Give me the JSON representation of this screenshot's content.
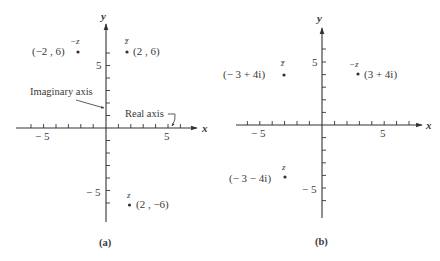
{
  "panels": [
    {
      "id": "a",
      "caption": "(a)",
      "origin_px": [
        106,
        128
      ],
      "unit_px": 12.4,
      "x_axis_label": "x",
      "y_axis_label": "y",
      "x_ticks_labeled": [
        {
          "value": -5,
          "label": "− 5"
        },
        {
          "value": 5,
          "label": "5"
        }
      ],
      "y_ticks_labeled": [
        {
          "value": 5,
          "label": "5"
        },
        {
          "value": -5,
          "label": "− 5"
        }
      ],
      "annotations": [
        {
          "text": "Imaginary axis",
          "points_to": "y-axis"
        },
        {
          "text": "Real axis",
          "points_to": "x-axis"
        }
      ],
      "points": [
        {
          "name": "−z",
          "coord_label": "(−2 , 6)",
          "x": -2,
          "y": 6
        },
        {
          "name": "z̅",
          "coord_label": "(2 , 6)",
          "x": 2,
          "y": 6
        },
        {
          "name": "z",
          "coord_label": "(2 , −6)",
          "x": 2,
          "y": -6
        }
      ]
    },
    {
      "id": "b",
      "caption": "(b)",
      "origin_px": [
        322,
        125
      ],
      "unit_px": 12.6,
      "x_axis_label": "x",
      "y_axis_label": "y",
      "x_ticks_labeled": [
        {
          "value": -5,
          "label": "− 5"
        },
        {
          "value": 5,
          "label": "5"
        }
      ],
      "y_ticks_labeled": [
        {
          "value": 5,
          "label": "5"
        },
        {
          "value": -5,
          "label": "− 5"
        }
      ],
      "points": [
        {
          "name": "z̅",
          "coord_label": "(− 3 + 4i)",
          "x": -3,
          "y": 4
        },
        {
          "name": "−z",
          "coord_label": "(3 + 4i)",
          "x": 3,
          "y": 4
        },
        {
          "name": "z",
          "coord_label": "(− 3 − 4i)",
          "x": -3,
          "y": -4
        }
      ]
    }
  ]
}
